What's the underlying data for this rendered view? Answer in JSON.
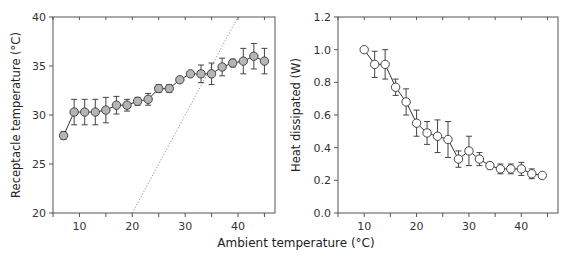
{
  "figure": {
    "shared_xlabel": "Ambient temperature (°C)"
  },
  "chart_data": [
    {
      "type": "line",
      "title": "",
      "xlabel": "Ambient temperature (°C)",
      "ylabel": "Receptacle temperature (°C)",
      "xlim": [
        5,
        47
      ],
      "ylim": [
        20,
        40
      ],
      "xticks": [
        10,
        20,
        30,
        40
      ],
      "yticks": [
        20,
        25,
        30,
        35,
        40
      ],
      "grid": false,
      "legend": null,
      "marker": {
        "shape": "circle",
        "fill": "#b5b5b5",
        "stroke": "#444444"
      },
      "reference_line": {
        "label": "y = x (dotted)",
        "from": [
          20,
          20
        ],
        "to": [
          40,
          40
        ],
        "style": "dotted"
      },
      "x": [
        7,
        9,
        11,
        13,
        15,
        17,
        19,
        21,
        23,
        25,
        27,
        29,
        31,
        33,
        35,
        37,
        39,
        41,
        43,
        45
      ],
      "values": [
        27.9,
        30.3,
        30.3,
        30.3,
        30.5,
        31.0,
        31.0,
        31.4,
        31.6,
        32.7,
        32.7,
        33.6,
        34.2,
        34.2,
        34.2,
        34.9,
        35.3,
        35.5,
        36.0,
        35.5
      ],
      "errors": [
        0.4,
        1.3,
        1.3,
        1.3,
        1.3,
        0.9,
        0.6,
        0.4,
        0.6,
        0.4,
        0.4,
        0.0,
        0.0,
        0.9,
        1.1,
        0.9,
        0.4,
        1.3,
        1.3,
        1.3
      ]
    },
    {
      "type": "line",
      "title": "",
      "xlabel": "Ambient temperature (°C)",
      "ylabel": "Heat dissipated (W)",
      "xlim": [
        5,
        47
      ],
      "ylim": [
        0.0,
        1.2
      ],
      "xticks": [
        10,
        20,
        30,
        40
      ],
      "yticks": [
        0.0,
        0.2,
        0.4,
        0.6,
        0.8,
        1.0,
        1.2
      ],
      "grid": false,
      "legend": null,
      "marker": {
        "shape": "circle",
        "fill": "#ffffff",
        "stroke": "#444444"
      },
      "x": [
        10,
        12,
        14,
        16,
        18,
        20,
        22,
        24,
        26,
        28,
        30,
        32,
        34,
        36,
        38,
        40,
        42,
        44
      ],
      "values": [
        1.0,
        0.91,
        0.91,
        0.77,
        0.68,
        0.55,
        0.49,
        0.47,
        0.45,
        0.33,
        0.38,
        0.33,
        0.29,
        0.27,
        0.27,
        0.27,
        0.24,
        0.23
      ],
      "errors": [
        0.0,
        0.08,
        0.09,
        0.05,
        0.08,
        0.08,
        0.07,
        0.1,
        0.11,
        0.05,
        0.09,
        0.04,
        0.02,
        0.03,
        0.03,
        0.04,
        0.03,
        0.0
      ]
    }
  ]
}
